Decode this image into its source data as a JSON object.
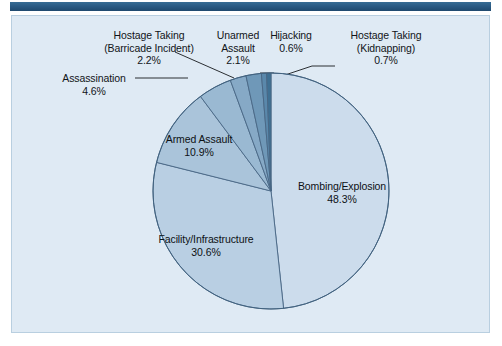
{
  "page": {
    "background_color": "#ffffff",
    "panel_color": "#dfeaf4",
    "panel_border_color": "#b9cfe0",
    "top_rule_color": "#2a5a83"
  },
  "chart_data": {
    "type": "pie",
    "title": "",
    "subtitle": "",
    "xlabel": "",
    "ylabel": "",
    "legend_position": "none",
    "grid": false,
    "units": "percent",
    "total": 100.0,
    "start_angle_deg": 0,
    "direction": "clockwise",
    "categories": [
      "Bombing/Explosion",
      "Facility/Infrastructure",
      "Armed Assault",
      "Assassination",
      "Hostage Taking (Barricade Incident)",
      "Unarmed Assault",
      "Hostage Taking (Kidnapping)",
      "Hijacking"
    ],
    "values": [
      48.3,
      30.6,
      10.9,
      4.6,
      2.2,
      2.1,
      0.7,
      0.6
    ],
    "colors": [
      "#ccdcec",
      "#b9cfe3",
      "#aac4da",
      "#9ab9d2",
      "#86a9c6",
      "#6f98b8",
      "#5a88ab",
      "#3f7093"
    ],
    "slice_labels": [
      {
        "name": "Bombing/Explosion",
        "percent": "48.3%",
        "placement": "inside"
      },
      {
        "name": "Facility/Infrastructure",
        "percent": "30.6%",
        "placement": "inside"
      },
      {
        "name": "Armed Assault",
        "percent": "10.9%",
        "placement": "inside"
      },
      {
        "name": "Assassination",
        "percent": "4.6%",
        "placement": "outside-left"
      },
      {
        "name": "Hostage Taking (Barricade Incident)",
        "percent": "2.2%",
        "placement": "outside-top-left"
      },
      {
        "name": "Unarmed Assault",
        "percent": "2.1%",
        "placement": "outside-top"
      },
      {
        "name": "Hijacking",
        "percent": "0.6%",
        "placement": "outside-top"
      },
      {
        "name": "Hostage Taking (Kidnapping)",
        "percent": "0.7%",
        "placement": "outside-top-right"
      }
    ]
  },
  "labels": {
    "barricade": {
      "line1": "Hostage Taking",
      "line2": "(Barricade Incident)",
      "pct": "2.2%"
    },
    "unarmed": {
      "line1": "Unarmed",
      "line2": "Assault",
      "pct": "2.1%"
    },
    "hijacking": {
      "line1": "Hijacking",
      "pct": "0.6%"
    },
    "kidnapping": {
      "line1": "Hostage Taking",
      "line2": "(Kidnapping)",
      "pct": "0.7%"
    },
    "assassination": {
      "line1": "Assassination",
      "pct": "4.6%"
    },
    "armed": {
      "line1": "Armed Assault",
      "pct": "10.9%"
    },
    "facility": {
      "line1": "Facility/Infrastructure",
      "pct": "30.6%"
    },
    "bombing": {
      "line1": "Bombing/Explosion",
      "pct": "48.3%"
    }
  }
}
